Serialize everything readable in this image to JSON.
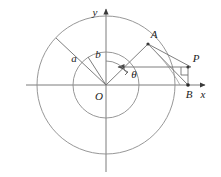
{
  "figure": {
    "background_color": "#ffffff",
    "stroke_color": "#6f6f6f",
    "axis_color": "#7a7a7a",
    "label_color": "#1c1c1c",
    "center": {
      "x": 106,
      "y": 85
    },
    "circles": [
      {
        "name": "outer-circle",
        "radius": 69,
        "label": "a"
      },
      {
        "name": "inner-circle",
        "radius": 33,
        "label": "b"
      }
    ],
    "axes": {
      "x_label": "x",
      "y_label": "y",
      "x_arrow": true,
      "y_arrow": true
    },
    "points": [
      {
        "name": "origin",
        "label": "O",
        "x": 106,
        "y": 85
      },
      {
        "name": "point-a",
        "label": "A",
        "x": 148,
        "y": 44
      },
      {
        "name": "point-p",
        "label": "P",
        "x": 191,
        "y": 67
      },
      {
        "name": "point-b",
        "label": "B",
        "x": 188,
        "y": 85
      }
    ],
    "labels": {
      "radius_outer": "a",
      "radius_inner": "b",
      "angle": "θ",
      "origin": "O",
      "point_a": "A",
      "point_p": "P",
      "point_b": "B",
      "axis_x": "x",
      "axis_y": "y"
    },
    "marks": {
      "right_angle_at": "P",
      "angle_arc_at": "O",
      "arrow_on_horizontal_segment": "left"
    }
  }
}
